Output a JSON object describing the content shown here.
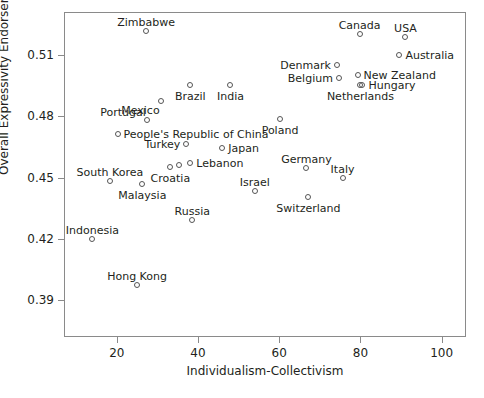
{
  "chart_data": {
    "type": "scatter",
    "title": "",
    "xlabel": "Individualism-Collectivism",
    "ylabel": "Overall Expressivity Endorsement",
    "xlim": [
      7,
      106
    ],
    "ylim": [
      0.372,
      0.531
    ],
    "xticks": [
      20,
      40,
      60,
      80,
      100
    ],
    "yticks": [
      "0.39",
      "0.42",
      "0.45",
      "0.48",
      "0.51"
    ],
    "ytick_values": [
      0.39,
      0.42,
      0.45,
      0.48,
      0.51
    ],
    "grid": false,
    "legend": null,
    "points": [
      {
        "label": "Zimbabwe",
        "x": 27.2,
        "y": 0.5217,
        "label_pos": "above-center"
      },
      {
        "label": "Canada",
        "x": 79.8,
        "y": 0.5202,
        "label_pos": "above-center"
      },
      {
        "label": "USA",
        "x": 91.1,
        "y": 0.5187,
        "label_pos": "above-center"
      },
      {
        "label": "Australia",
        "x": 89.6,
        "y": 0.5101,
        "label_pos": "right"
      },
      {
        "label": "Denmark",
        "x": 74.2,
        "y": 0.505,
        "label_pos": "left"
      },
      {
        "label": "New Zealand",
        "x": 79.3,
        "y": 0.5004,
        "label_pos": "right"
      },
      {
        "label": "Belgium",
        "x": 74.7,
        "y": 0.4989,
        "label_pos": "left"
      },
      {
        "label": "Hungary",
        "x": 80.5,
        "y": 0.4954,
        "label_pos": "right"
      },
      {
        "label": "Netherlands",
        "x": 80.0,
        "y": 0.4954,
        "label_pos": "below-center"
      },
      {
        "label": "Brazil",
        "x": 38.1,
        "y": 0.4954,
        "label_pos": "below-center"
      },
      {
        "label": "India",
        "x": 48.0,
        "y": 0.4954,
        "label_pos": "below-center"
      },
      {
        "label": "Mexico",
        "x": 30.8,
        "y": 0.4873,
        "label_pos": "below-left"
      },
      {
        "label": "Portugal",
        "x": 27.4,
        "y": 0.4781,
        "label_pos": "above-left"
      },
      {
        "label": "People's Republic of China",
        "x": 20.2,
        "y": 0.4715,
        "label_pos": "right"
      },
      {
        "label": "Poland",
        "x": 60.2,
        "y": 0.4786,
        "label_pos": "below-center"
      },
      {
        "label": "Turkey",
        "x": 37.1,
        "y": 0.4664,
        "label_pos": "left"
      },
      {
        "label": "Japan",
        "x": 46.0,
        "y": 0.4644,
        "label_pos": "right"
      },
      {
        "label": "Lebanon",
        "x": 38.1,
        "y": 0.4573,
        "label_pos": "right"
      },
      {
        "label": "Germany",
        "x": 66.7,
        "y": 0.4546,
        "label_pos": "above-center"
      },
      {
        "label": "Italy",
        "x": 75.6,
        "y": 0.45,
        "label_pos": "above-center"
      },
      {
        "label": "South Korea",
        "x": 18.3,
        "y": 0.4485,
        "label_pos": "above-center"
      },
      {
        "label": "Croatia",
        "x": 33.2,
        "y": 0.4551,
        "label_pos": "below-center"
      },
      {
        "label": "Croatia-2",
        "x": 35.2,
        "y": 0.4562,
        "label_pos": "none"
      },
      {
        "label": "Malaysia",
        "x": 26.3,
        "y": 0.447,
        "label_pos": "below-center"
      },
      {
        "label": "Israel",
        "x": 54.0,
        "y": 0.4434,
        "label_pos": "above-center"
      },
      {
        "label": "Switzerland",
        "x": 67.2,
        "y": 0.4403,
        "label_pos": "below-center"
      },
      {
        "label": "Russia",
        "x": 38.6,
        "y": 0.429,
        "label_pos": "above-center"
      },
      {
        "label": "Indonesia",
        "x": 14.0,
        "y": 0.42,
        "label_pos": "above-center"
      },
      {
        "label": "Hong Kong",
        "x": 25.0,
        "y": 0.3975,
        "label_pos": "above-center"
      }
    ]
  }
}
